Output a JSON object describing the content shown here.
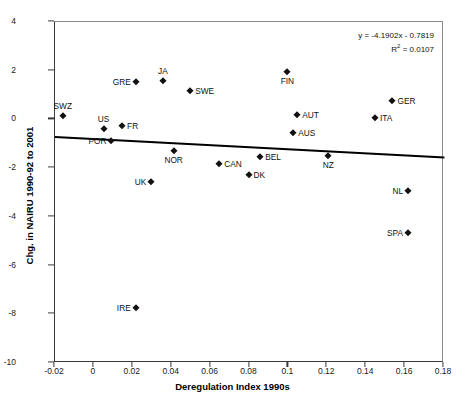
{
  "chart_data": {
    "type": "scatter",
    "title": "",
    "xlabel": "Deregulation Index 1990s",
    "ylabel": "Chg. in NAIRU 1990-92 to 2001",
    "xlim": [
      -0.02,
      0.18
    ],
    "ylim": [
      -10,
      4
    ],
    "xticks": [
      "-0.02",
      "0",
      "0.02",
      "0.04",
      "0.06",
      "0.08",
      "0.1",
      "0.12",
      "0.14",
      "0.16",
      "0.18"
    ],
    "xtick_values": [
      -0.02,
      0,
      0.02,
      0.04,
      0.06,
      0.08,
      0.1,
      0.12,
      0.14,
      0.16,
      0.18
    ],
    "yticks": [
      "4",
      "2",
      "0",
      "-2",
      "-4",
      "-6",
      "-8",
      "-10"
    ],
    "ytick_values": [
      4,
      2,
      0,
      -2,
      -4,
      -6,
      -8,
      -10
    ],
    "grid": false,
    "legend": false,
    "marker": "diamond",
    "marker_color": "#111111",
    "trendline": {
      "equation": "y = -4.1902x - 0.7819",
      "r_squared_label": "R",
      "r_squared_sup": "2",
      "r_squared_value": " = 0.0107",
      "slope": -4.1902,
      "intercept": -0.7819,
      "color": "#000000"
    },
    "points": [
      {
        "label": "SWZ",
        "x": -0.016,
        "y": 0.15,
        "label_pos": "above"
      },
      {
        "label": "US",
        "x": 0.005,
        "y": -0.4,
        "label_pos": "above"
      },
      {
        "label": "POR",
        "x": 0.009,
        "y": -0.88,
        "label_pos": "left"
      },
      {
        "label": "FR",
        "x": 0.0145,
        "y": -0.27,
        "label_pos": "right"
      },
      {
        "label": "GRE",
        "x": 0.0215,
        "y": 1.55,
        "label_pos": "left"
      },
      {
        "label": "IRE",
        "x": 0.0215,
        "y": -7.75,
        "label_pos": "left"
      },
      {
        "label": "UK",
        "x": 0.0295,
        "y": -2.55,
        "label_pos": "left"
      },
      {
        "label": "JA",
        "x": 0.0355,
        "y": 1.58,
        "label_pos": "above"
      },
      {
        "label": "NOR",
        "x": 0.041,
        "y": -1.3,
        "label_pos": "below"
      },
      {
        "label": "SWE",
        "x": 0.0495,
        "y": 1.18,
        "label_pos": "right"
      },
      {
        "label": "CAN",
        "x": 0.0645,
        "y": -1.82,
        "label_pos": "right"
      },
      {
        "label": "DK",
        "x": 0.0795,
        "y": -2.3,
        "label_pos": "right"
      },
      {
        "label": "BEL",
        "x": 0.0855,
        "y": -1.53,
        "label_pos": "right"
      },
      {
        "label": "FIN",
        "x": 0.0995,
        "y": 1.93,
        "label_pos": "below"
      },
      {
        "label": "AUS",
        "x": 0.1025,
        "y": -0.57,
        "label_pos": "right"
      },
      {
        "label": "AUT",
        "x": 0.1045,
        "y": 0.2,
        "label_pos": "right"
      },
      {
        "label": "NZ",
        "x": 0.1205,
        "y": -1.5,
        "label_pos": "below"
      },
      {
        "label": "ITA",
        "x": 0.1445,
        "y": 0.05,
        "label_pos": "right"
      },
      {
        "label": "GER",
        "x": 0.1535,
        "y": 0.75,
        "label_pos": "right"
      },
      {
        "label": "NL",
        "x": 0.1615,
        "y": -2.95,
        "label_pos": "left"
      },
      {
        "label": "SPA",
        "x": 0.1615,
        "y": -4.65,
        "label_pos": "left"
      }
    ]
  }
}
